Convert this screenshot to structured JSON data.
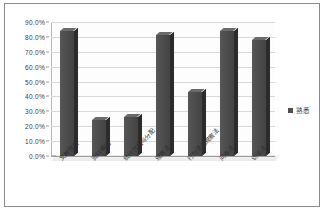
{
  "chart_data": {
    "type": "bar",
    "title": "",
    "subtitle": "",
    "xlabel": "",
    "ylabel": "",
    "categories": [
      "文献搜索",
      "资料编码",
      "统计分组与分配",
      "观察法",
      "行为活动观察法",
      "问卷法",
      "访谈法"
    ],
    "series": [
      {
        "name": "熟悉",
        "values": [
          84.0,
          24.0,
          26.0,
          81.0,
          43.0,
          84.0,
          78.0
        ]
      }
    ],
    "ylim": [
      0,
      90
    ],
    "y_ticks": [
      "90.0%",
      "80.0%",
      "70.0%",
      "60.0%",
      "50.0%",
      "40.0%",
      "30.0%",
      "20.0%",
      "10.0%",
      "0.0%"
    ],
    "y_tick_values": [
      90,
      80,
      70,
      60,
      50,
      40,
      30,
      20,
      10,
      0
    ],
    "grid": true,
    "legend_position": "right",
    "colors": {
      "bar_front": "#4f4f4f",
      "bar_side": "#2b2b2b",
      "bar_top": "#6a6a6a",
      "gridline": "#d8d8d8",
      "axis": "#9c9c9c",
      "frame": "#8a8a8a",
      "plot_background": "#fdfdfd",
      "text": "#2e2e2e"
    }
  },
  "legend": {
    "entries": [
      {
        "label": "熟悉",
        "color": "#4f4f4f"
      }
    ]
  }
}
